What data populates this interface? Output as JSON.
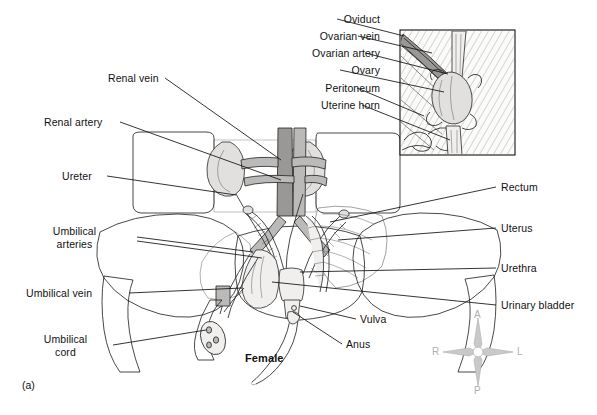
{
  "figure": {
    "caption": "(a)",
    "subject_label": "Female"
  },
  "labels_top_right": [
    {
      "name": "oviduct",
      "text": "Oviduct"
    },
    {
      "name": "ovarian-vein",
      "text": "Ovarian vein"
    },
    {
      "name": "ovarian-artery",
      "text": "Ovarian artery"
    },
    {
      "name": "ovary",
      "text": "Ovary"
    },
    {
      "name": "peritoneum",
      "text": "Peritoneum"
    },
    {
      "name": "uterine-horn",
      "text": "Uterine horn"
    }
  ],
  "labels_left": [
    {
      "name": "renal-vein",
      "text": "Renal vein"
    },
    {
      "name": "renal-artery",
      "text": "Renal artery"
    },
    {
      "name": "ureter",
      "text": "Ureter"
    },
    {
      "name": "umbilical-arteries",
      "line1": "Umbilical",
      "line2": "arteries"
    },
    {
      "name": "umbilical-vein",
      "text": "Umbilical vein"
    },
    {
      "name": "umbilical-cord",
      "line1": "Umbilical",
      "line2": "cord"
    }
  ],
  "labels_right": [
    {
      "name": "rectum",
      "text": "Rectum"
    },
    {
      "name": "uterus",
      "text": "Uterus"
    },
    {
      "name": "urethra",
      "text": "Urethra"
    },
    {
      "name": "urinary-bladder",
      "text": "Urinary bladder"
    }
  ],
  "labels_center": [
    {
      "name": "vulva",
      "text": "Vulva"
    },
    {
      "name": "anus",
      "text": "Anus"
    }
  ],
  "compass": {
    "anterior": "A",
    "right": "R",
    "left": "L",
    "posterior": "P",
    "color": "#b0b0b0"
  },
  "colors": {
    "background": "#ffffff",
    "ink": "#111111",
    "tissue_light": "#f0efee",
    "tissue_mid": "#e2e0de",
    "tissue_dark": "#bcbab8",
    "vessel_dark": "#9a9896"
  }
}
